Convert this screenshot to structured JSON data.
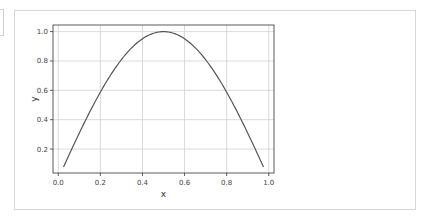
{
  "cell": {
    "prompt": ""
  },
  "chart_data": {
    "type": "line",
    "title": "",
    "xlabel": "x",
    "ylabel": "y",
    "xlim": [
      -0.025,
      1.025
    ],
    "ylim": [
      0.037,
      1.045
    ],
    "grid": true,
    "legend": null,
    "x_ticks": [
      0.0,
      0.2,
      0.4,
      0.6,
      0.8,
      1.0
    ],
    "x_tick_labels": [
      "0.0",
      "0.2",
      "0.4",
      "0.6",
      "0.8",
      "1.0"
    ],
    "y_ticks": [
      0.2,
      0.4,
      0.6,
      0.8,
      1.0
    ],
    "y_tick_labels": [
      "0.2",
      "0.4",
      "0.6",
      "0.8",
      "1.0"
    ],
    "series": [
      {
        "name": "sin(pi x)",
        "color": "#555555",
        "x": [
          0.025,
          0.05,
          0.1,
          0.15,
          0.2,
          0.25,
          0.3,
          0.35,
          0.4,
          0.45,
          0.5,
          0.55,
          0.6,
          0.65,
          0.7,
          0.75,
          0.8,
          0.85,
          0.9,
          0.95,
          0.975
        ],
        "y": [
          0.078,
          0.156,
          0.309,
          0.454,
          0.588,
          0.707,
          0.809,
          0.891,
          0.951,
          0.988,
          1.0,
          0.988,
          0.951,
          0.891,
          0.809,
          0.707,
          0.588,
          0.454,
          0.309,
          0.156,
          0.078
        ]
      }
    ]
  }
}
